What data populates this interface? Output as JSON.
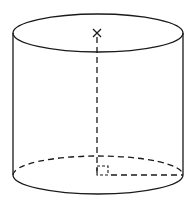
{
  "diagram": {
    "type": "cylinder",
    "elements": {
      "top_face": {
        "shape": "ellipse",
        "style": "solid"
      },
      "bottom_face_front": {
        "shape": "half-ellipse",
        "style": "solid"
      },
      "bottom_face_back": {
        "shape": "half-ellipse",
        "style": "dashed"
      },
      "left_side": {
        "shape": "line",
        "style": "solid"
      },
      "right_side": {
        "shape": "line",
        "style": "solid"
      },
      "top_center_mark": {
        "shape": "x-mark",
        "style": "solid"
      },
      "height_line": {
        "shape": "line",
        "style": "dashed"
      },
      "base_radius": {
        "shape": "line",
        "style": "dashed"
      },
      "right_angle_marker": {
        "shape": "square",
        "style": "dashed"
      }
    },
    "colors": {
      "stroke": "#1a1a1a",
      "background": "#ffffff"
    }
  }
}
